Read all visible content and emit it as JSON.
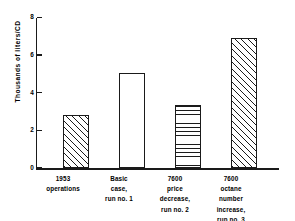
{
  "chart_data": {
    "type": "bar",
    "title": "",
    "subtitle": "",
    "xlabel": "",
    "ylabel": "Thousands of liters/CD",
    "ylim": [
      0,
      8
    ],
    "ytick_labels": [
      "0",
      "2",
      "4",
      "6",
      "8"
    ],
    "ytick_values": [
      0,
      2,
      4,
      6,
      8
    ],
    "grid": false,
    "legend": "none",
    "categories": [
      "1953 operations",
      "Basic case, run no. 1",
      "7600 price decrease, run no. 2",
      "7600 octane number increase, run no. 3"
    ],
    "category_lines": [
      [
        "1953",
        "operations"
      ],
      [
        "Basic",
        "case,",
        "run no. 1"
      ],
      [
        "7600",
        "price",
        "decrease,",
        "run no. 2"
      ],
      [
        "7600",
        "octane",
        "number",
        "increase,",
        "run no. 3"
      ]
    ],
    "values": [
      2.8,
      5.0,
      3.35,
      6.85
    ],
    "bar_fills": [
      "diagonal-hatch",
      "none",
      "horizontal-hatch",
      "diagonal-hatch"
    ],
    "axis_color": "#1a1a1a",
    "bar_edge_color": "#1a1a1a",
    "bar_face_color": "#ffffff",
    "background_color": "#ffffff"
  }
}
